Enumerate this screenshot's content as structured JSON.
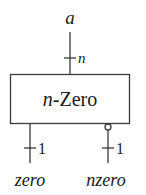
{
  "diagram": {
    "block": {
      "prefix": "n",
      "suffix": "-Zero"
    },
    "input": {
      "name": "a",
      "width_label": "n"
    },
    "outputs": [
      {
        "name": "zero",
        "width_label": "1",
        "inverted": false
      },
      {
        "name": "nzero",
        "width_label": "1",
        "inverted": true
      }
    ],
    "colors": {
      "stroke": "#3a3a3a",
      "text": "#1a1a1a",
      "background": "#ffffff"
    }
  }
}
